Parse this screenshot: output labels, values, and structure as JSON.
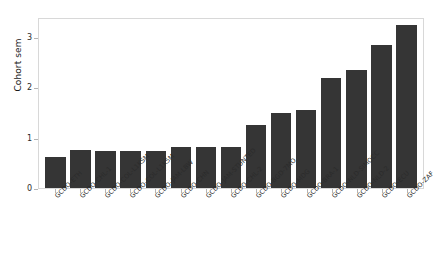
{
  "chart_data": {
    "type": "bar",
    "title": "",
    "xlabel": "",
    "ylabel": "Cohort sem",
    "ylim": [
      0,
      3.4
    ],
    "yticks": [
      0,
      1,
      2,
      3
    ],
    "ytick_labels": [
      "0",
      "1",
      "2",
      "3"
    ],
    "grid": false,
    "legend": null,
    "bar_color": "#353535",
    "categories": [
      "GCDO-ETH",
      "GCDO-CHL-1",
      "GCDO-COL-L1KSM",
      "GCDO-COL-L1K5M",
      "GCDO-JAM-LBW",
      "GCDO-CHN",
      "GCDO-JAM-STUNTED",
      "GCDO-CHL-2",
      "GCDO-BGD-7MO",
      "GCDO-MDG",
      "GCDO-BRA-1",
      "GCDO-NLD-SIMOCC",
      "GCDO-NLD-2",
      "GCDO-ECU",
      "GCDO-ZAF"
    ],
    "values": [
      0.62,
      0.75,
      0.74,
      0.74,
      0.74,
      0.82,
      0.82,
      0.82,
      1.25,
      1.5,
      1.55,
      2.18,
      2.35,
      2.85,
      3.25
    ]
  }
}
